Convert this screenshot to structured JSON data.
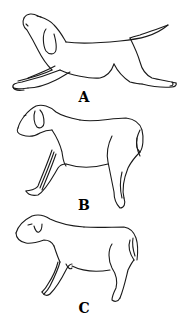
{
  "figure": {
    "panels": [
      {
        "id": "A",
        "label": "A",
        "description": "dog stretching forward, head raised, forelegs extended forward, hind legs extended back, tail up"
      },
      {
        "id": "B",
        "label": "B",
        "description": "dog standing, forelegs angled forward, hind legs straight, tail down"
      },
      {
        "id": "C",
        "label": "C",
        "description": "dog standing in neutral posture, head lowered, eye closed, tail down"
      }
    ],
    "colors": {
      "background": "#ffffff",
      "line": "#1a1a1a"
    }
  }
}
